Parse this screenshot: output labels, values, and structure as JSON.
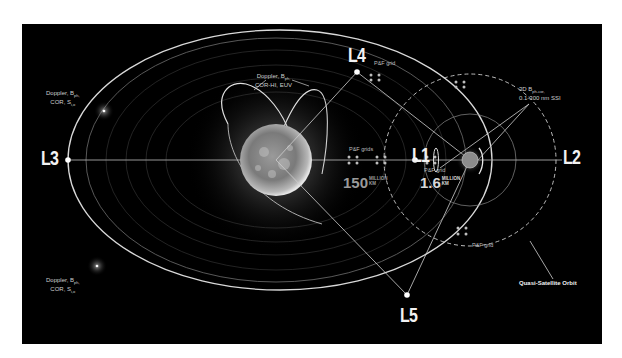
{
  "diagram": {
    "background_color": "#000000",
    "line_color": "#d9d9d9",
    "lagrange_points": [
      {
        "id": "L1",
        "label": "L1"
      },
      {
        "id": "L2",
        "label": "L2"
      },
      {
        "id": "L3",
        "label": "L3"
      },
      {
        "id": "L4",
        "label": "L4"
      },
      {
        "id": "L5",
        "label": "L5"
      }
    ],
    "annotations": {
      "upper_left_spacecraft": {
        "line1": "Doppler, B",
        "sub1": "ph,",
        "line2": "COR, S",
        "sub2": "i,o"
      },
      "lower_left_spacecraft": {
        "line1": "Doppler, B",
        "sub1": "ph,",
        "line2": "COR, S",
        "sub2": "i,o"
      },
      "polar_orbits": {
        "line1": "Doppler, B",
        "sub1": "ph,",
        "line2": "COR-HI, EUV"
      },
      "earth_instruments": {
        "line1": "3D B",
        "sub1": "ph-cor,",
        "line2": "0.1-300 nm SSI"
      },
      "pf_grid_l4": "P&F grid",
      "pf_grids_sun_l1": "P&F grids",
      "pf_grid_l1_earth": "P&F grid",
      "pf_grid_lower": "P&F grid",
      "quasi_satellite_orbit": "Quasi-Satellite Orbit"
    },
    "distances": {
      "sun_earth": {
        "value": "150",
        "unit_line1": "MILLION",
        "unit_line2": "KM"
      },
      "earth_l1": {
        "value": "1.6",
        "unit_line1": "MILLION",
        "unit_line2": "KM"
      }
    }
  }
}
